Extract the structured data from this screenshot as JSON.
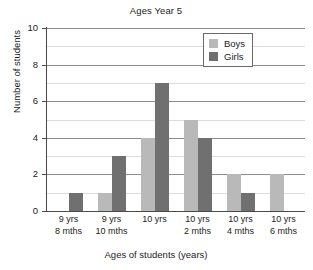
{
  "chart_data": {
    "type": "bar",
    "title": "Ages Year 5",
    "xlabel": "Ages of students (years)",
    "ylabel": "Number of students",
    "categories": [
      "9 yrs 8 mths",
      "9 yrs 10 mths",
      "10 yrs",
      "10 yrs 2 mths",
      "10 yrs 4 mths",
      "10 yrs 6 mths"
    ],
    "category_lines": [
      {
        "line1": "9 yrs",
        "line2": "8 mths"
      },
      {
        "line1": "9 yrs",
        "line2": "10 mths"
      },
      {
        "line1": "10 yrs",
        "line2": ""
      },
      {
        "line1": "10 yrs",
        "line2": "2 mths"
      },
      {
        "line1": "10 yrs",
        "line2": "4 mths"
      },
      {
        "line1": "10 yrs",
        "line2": "6 mths"
      }
    ],
    "series": [
      {
        "name": "Boys",
        "color": "#b9b9b9",
        "values": [
          0,
          1,
          4,
          5,
          2,
          2
        ]
      },
      {
        "name": "Girls",
        "color": "#707070",
        "values": [
          1,
          3,
          7,
          4,
          1,
          0
        ]
      }
    ],
    "ylim": [
      0,
      10
    ],
    "ytick_labels": [
      "0",
      "2",
      "4",
      "6",
      "8",
      "10"
    ],
    "ytick_values": [
      0,
      2,
      4,
      6,
      8,
      10
    ],
    "minor_gridline_values": [
      1,
      3,
      5,
      7,
      9
    ],
    "grid": true,
    "legend_position": "top-right"
  },
  "legend": {
    "items": [
      {
        "label": "Boys",
        "color": "#b9b9b9"
      },
      {
        "label": "Girls",
        "color": "#707070"
      }
    ]
  }
}
